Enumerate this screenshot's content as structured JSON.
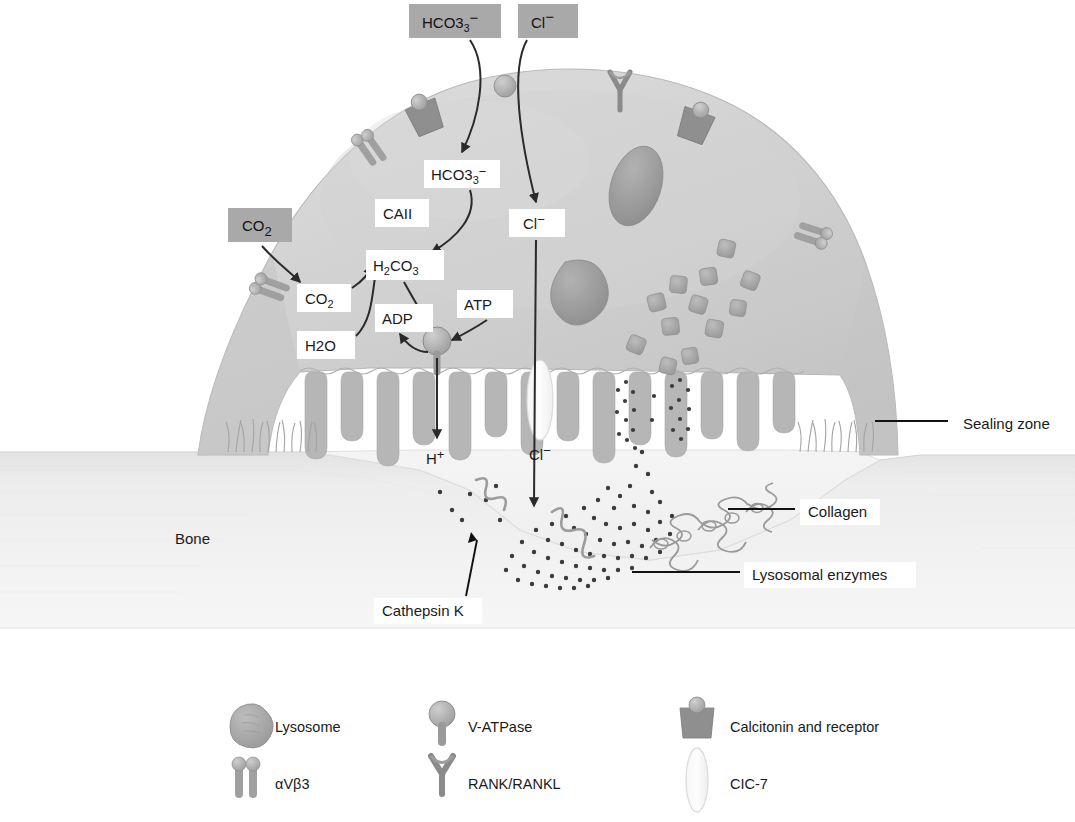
{
  "figure": {
    "background_color": "#ffffff"
  },
  "colors": {
    "gray_box_bg": "#a9a9a9",
    "cell_body": "#c9c9c9",
    "cell_body_light": "#d6d6d6",
    "ruffled_border": "#b4b4b4",
    "bone": "#ececec",
    "bone_edge": "#d8d8d8",
    "organelle": "#9a9a9a",
    "lysosome": "#a0a0a0",
    "text": "#1a1a1a",
    "leader_line": "#111111",
    "arrow": "#2a2a2a",
    "resorption_lacuna": "#f2f2f2"
  },
  "external_inputs": [
    {
      "id": "hco3-external",
      "label": "HCO3",
      "sup": "−",
      "x": 409,
      "y": 4,
      "w": 92,
      "h": 34,
      "style": "gray"
    },
    {
      "id": "cl-external",
      "label": "Cl",
      "sup": "−",
      "x": 518,
      "y": 4,
      "w": 60,
      "h": 34,
      "style": "gray"
    },
    {
      "id": "co2-external",
      "label": "CO",
      "sub": "2",
      "x": 228,
      "y": 208,
      "w": 64,
      "h": 34,
      "style": "gray"
    }
  ],
  "internal_labels": [
    {
      "id": "hco3-internal",
      "label": "HCO3",
      "sup": "−",
      "x": 424,
      "y": 160,
      "w": 74,
      "h": 28,
      "style": "white"
    },
    {
      "id": "caii",
      "label": "CAII",
      "x": 375,
      "y": 199,
      "w": 52,
      "h": 28,
      "style": "white"
    },
    {
      "id": "cl-internal",
      "label": "Cl",
      "sup": "−",
      "x": 509,
      "y": 209,
      "w": 54,
      "h": 28,
      "style": "white"
    },
    {
      "id": "co2-internal",
      "label": "CO",
      "sub": "2",
      "x": 297,
      "y": 284,
      "w": 52,
      "h": 28,
      "style": "white"
    },
    {
      "id": "h2co3",
      "label": "H2CO3",
      "x": 366,
      "y": 250,
      "w": 76,
      "h": 30,
      "style": "white"
    },
    {
      "id": "h2o",
      "label": "H2O",
      "x": 297,
      "y": 331,
      "w": 56,
      "h": 28,
      "style": "white"
    },
    {
      "id": "adp",
      "label": "ADP",
      "x": 375,
      "y": 304,
      "w": 56,
      "h": 28,
      "style": "white"
    },
    {
      "id": "atp",
      "label": "ATP",
      "x": 457,
      "y": 290,
      "w": 54,
      "h": 28,
      "style": "white"
    },
    {
      "id": "h-plus",
      "label": "H",
      "sup": "+",
      "x": 426,
      "y": 444,
      "w": 34,
      "h": 26,
      "style": "plain"
    },
    {
      "id": "cl-lumen",
      "label": "Cl",
      "sup": "−",
      "x": 529,
      "y": 440,
      "w": 36,
      "h": 26,
      "style": "plain"
    }
  ],
  "callouts": [
    {
      "id": "sealing-zone",
      "label": "Sealing zone",
      "text_x": 963,
      "text_y": 427,
      "box_x": 955,
      "box_y": 411,
      "box_w": 104,
      "box_h": 26,
      "line": {
        "x1": 875,
        "y1": 421,
        "x2": 948,
        "y2": 421
      }
    },
    {
      "id": "collagen",
      "label": "Collagen",
      "text_x": 808,
      "text_y": 515,
      "box_x": 800,
      "box_y": 499,
      "box_w": 78,
      "box_h": 26,
      "line": {
        "x1": 728,
        "y1": 509,
        "x2": 795,
        "y2": 509
      }
    },
    {
      "id": "lysosomal-enzymes",
      "label": "Lysosomal enzymes",
      "text_x": 752,
      "text_y": 578,
      "box_x": 744,
      "box_y": 562,
      "box_w": 168,
      "box_h": 26,
      "line": {
        "x1": 632,
        "y1": 572,
        "x2": 740,
        "y2": 572
      }
    },
    {
      "id": "cathepsin-k",
      "label": "Cathepsin K",
      "text_x": 382,
      "text_y": 614,
      "box_x": 374,
      "box_y": 598,
      "box_w": 104,
      "box_h": 26,
      "line": {
        "x1": 465,
        "y1": 594,
        "x2": 472,
        "y2": 537
      }
    },
    {
      "id": "bone",
      "label": "Bone",
      "text_x": 175,
      "text_y": 544,
      "style": "plain"
    }
  ],
  "legend": {
    "items": [
      {
        "id": "lysosome",
        "label": "Lysosome",
        "icon": "lysosome-icon",
        "icon_x": 238,
        "icon_y": 705,
        "text_x": 275,
        "text_y": 732
      },
      {
        "id": "v-atpase",
        "label": "V-ATPase",
        "icon": "vatpase-icon",
        "icon_x": 430,
        "icon_y": 702,
        "text_x": 468,
        "text_y": 732
      },
      {
        "id": "calcitonin",
        "label": "Calcitonin and receptor",
        "icon": "calcitonin-icon",
        "icon_x": 683,
        "icon_y": 703,
        "text_x": 730,
        "text_y": 732
      },
      {
        "id": "avb3",
        "label": "αVβ3",
        "icon": "integrin-icon",
        "icon_x": 238,
        "icon_y": 762,
        "text_x": 275,
        "text_y": 789
      },
      {
        "id": "rank",
        "label": "RANK/RANKL",
        "icon": "rank-icon",
        "icon_x": 430,
        "icon_y": 760,
        "text_x": 468,
        "text_y": 789
      },
      {
        "id": "clc7",
        "label": "CIC-7",
        "icon": "clc7-icon",
        "icon_x": 683,
        "icon_y": 758,
        "text_x": 730,
        "text_y": 789
      }
    ]
  },
  "membrane_proteins": {
    "calcitonin_receptors": [
      {
        "x": 420,
        "y": 104
      },
      {
        "x": 694,
        "y": 108
      }
    ],
    "rank_receptors": [
      {
        "x": 620,
        "y": 74
      }
    ],
    "integrins": [
      {
        "x": 362,
        "y": 138,
        "rot": -32
      },
      {
        "x": 258,
        "y": 282,
        "rot": -12
      },
      {
        "x": 818,
        "y": 230,
        "rot": 20
      }
    ],
    "exchanger": [
      {
        "x": 505,
        "y": 84
      }
    ]
  },
  "organelles": {
    "nuclei": [
      {
        "cx": 636,
        "cy": 186,
        "rx": 25,
        "ry": 40,
        "rot": 18
      },
      {
        "cx": 588,
        "cy": 282,
        "rx": 26,
        "ry": 33,
        "rot": -30
      }
    ],
    "lysosome_count": 12
  }
}
